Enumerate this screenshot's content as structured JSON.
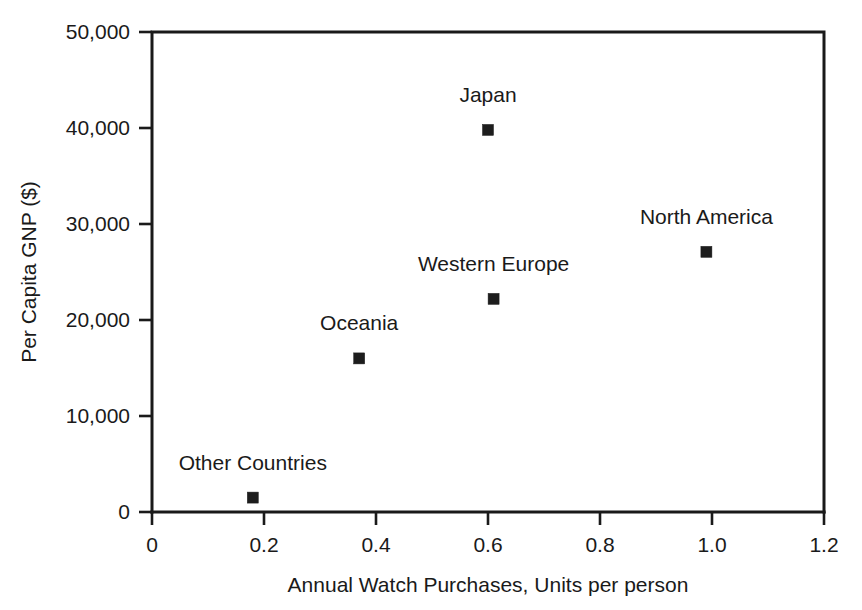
{
  "chart_data": {
    "type": "scatter",
    "title": "",
    "xlabel": "Annual Watch Purchases, Units per person",
    "ylabel": "Per Capita GNP ($)",
    "xlim": [
      0,
      1.2
    ],
    "ylim": [
      0,
      50000
    ],
    "grid": false,
    "legend": "none",
    "marker_style": "filled-square",
    "marker_color": "#1d1d1d",
    "x_ticks": [
      "0",
      "0.2",
      "0.4",
      "0.6",
      "0.8",
      "1.0",
      "1.2"
    ],
    "x_tick_values": [
      0,
      0.2,
      0.4,
      0.6,
      0.8,
      1.0,
      1.2
    ],
    "y_ticks": [
      "0",
      "10,000",
      "20,000",
      "30,000",
      "40,000",
      "50,000"
    ],
    "y_tick_values": [
      0,
      10000,
      20000,
      30000,
      40000,
      50000
    ],
    "points": [
      {
        "label": "Other Countries",
        "x": 0.18,
        "y": 1500,
        "label_dx": 0,
        "label_dy": -28
      },
      {
        "label": "Oceania",
        "x": 0.37,
        "y": 16000,
        "label_dx": 0,
        "label_dy": -28
      },
      {
        "label": "Western Europe",
        "x": 0.61,
        "y": 22200,
        "label_dx": 0,
        "label_dy": -28
      },
      {
        "label": "Japan",
        "x": 0.6,
        "y": 39800,
        "label_dx": 0,
        "label_dy": -28
      },
      {
        "label": "North America",
        "x": 0.99,
        "y": 27100,
        "label_dx": 0,
        "label_dy": -28
      }
    ]
  }
}
